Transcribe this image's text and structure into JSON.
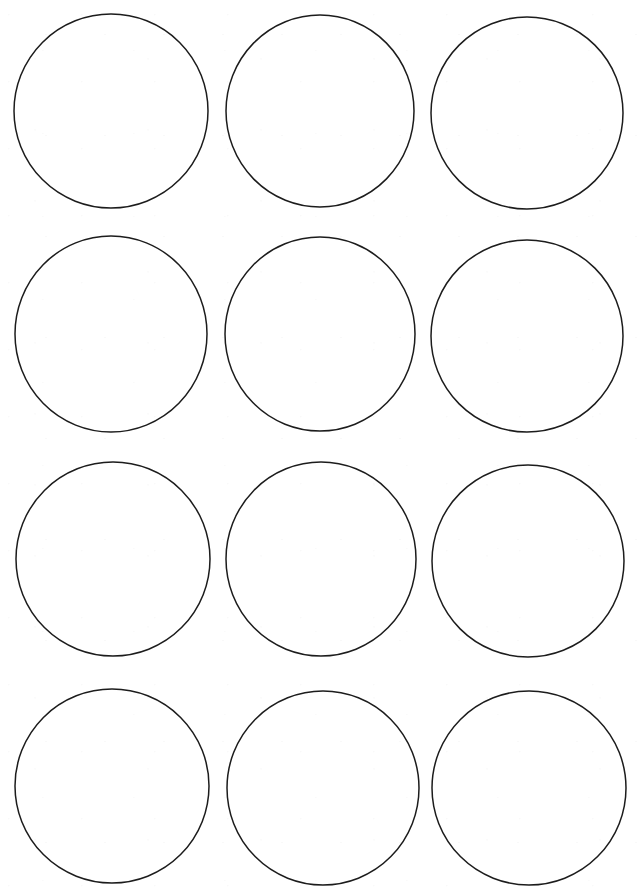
{
  "document": {
    "title": "Blank Circle Template",
    "kind": "printable-template",
    "paper_color": "#ffffff",
    "ink_color": "#1c1c1c",
    "width": 639,
    "height": 889
  },
  "template": {
    "shape": "circle",
    "rows": 4,
    "columns": 3,
    "count": 12,
    "stroke_width": 1.5,
    "fill": "none",
    "diameter": 193,
    "column_centers": [
      111,
      320,
      527
    ],
    "row_centers": [
      111,
      334,
      559,
      786
    ],
    "circles": [
      {
        "index": 1,
        "row": 1,
        "column": 1,
        "cx": 111,
        "cy": 111,
        "rx": 97,
        "ry": 97
      },
      {
        "index": 2,
        "row": 1,
        "column": 2,
        "cx": 320,
        "cy": 111,
        "rx": 94,
        "ry": 96
      },
      {
        "index": 3,
        "row": 1,
        "column": 3,
        "cx": 527,
        "cy": 113,
        "rx": 96,
        "ry": 96
      },
      {
        "index": 4,
        "row": 2,
        "column": 1,
        "cx": 111,
        "cy": 334,
        "rx": 96,
        "ry": 98
      },
      {
        "index": 5,
        "row": 2,
        "column": 2,
        "cx": 320,
        "cy": 334,
        "rx": 95,
        "ry": 97
      },
      {
        "index": 6,
        "row": 2,
        "column": 3,
        "cx": 527,
        "cy": 336,
        "rx": 96,
        "ry": 96
      },
      {
        "index": 7,
        "row": 3,
        "column": 1,
        "cx": 113,
        "cy": 559,
        "rx": 97,
        "ry": 97
      },
      {
        "index": 8,
        "row": 3,
        "column": 2,
        "cx": 321,
        "cy": 559,
        "rx": 95,
        "ry": 97
      },
      {
        "index": 9,
        "row": 3,
        "column": 3,
        "cx": 528,
        "cy": 561,
        "rx": 96,
        "ry": 96
      },
      {
        "index": 10,
        "row": 4,
        "column": 1,
        "cx": 112,
        "cy": 786,
        "rx": 97,
        "ry": 97
      },
      {
        "index": 11,
        "row": 4,
        "column": 2,
        "cx": 323,
        "cy": 788,
        "rx": 96,
        "ry": 97
      },
      {
        "index": 12,
        "row": 4,
        "column": 3,
        "cx": 529,
        "cy": 788,
        "rx": 97,
        "ry": 97
      }
    ]
  }
}
